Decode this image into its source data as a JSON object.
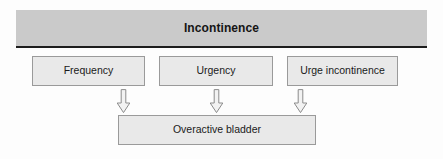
{
  "diagram": {
    "header": {
      "title": "Incontinence"
    },
    "top_nodes": [
      {
        "id": "frequency",
        "label": "Frequency"
      },
      {
        "id": "urgency",
        "label": "Urgency"
      },
      {
        "id": "urge-incontinence",
        "label": "Urge incontinence"
      }
    ],
    "bottom_node": {
      "id": "overactive-bladder",
      "label": "Overactive bladder"
    },
    "arrows": [
      {
        "id": "arrow-frequency",
        "from": "Frequency",
        "to": "Overactive bladder",
        "direction": "down"
      },
      {
        "id": "arrow-urgency",
        "from": "Urgency",
        "to": "Overactive bladder",
        "direction": "down"
      },
      {
        "id": "arrow-urge-incontinence",
        "from": "Urge incontinence",
        "to": "Overactive bladder",
        "direction": "down"
      }
    ],
    "colors": {
      "header_fill": "#cacaca",
      "header_border": "#1d1d1d",
      "node_fill": "#e9e9e9",
      "node_border": "#9a9a9a",
      "text": "#1a1a1a",
      "background": "#fdfdfd",
      "arrow_fill": "#f2f2f2",
      "arrow_stroke": "#8c8c8c"
    }
  }
}
